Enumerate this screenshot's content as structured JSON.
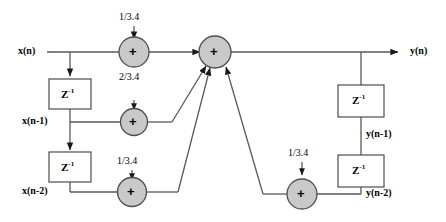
{
  "diagram": {
    "type": "signal-flow-diagram",
    "colors": {
      "line": "#595959",
      "adder_fill": "#c9c9c9",
      "adder_stroke": "#4d4d4d",
      "box_stroke": "#4d4d4d",
      "box_fill": "#ffffff",
      "text": "#000000",
      "background": "#ffffff"
    },
    "signals": {
      "input": "x(n)",
      "input_d1": "x(n-1)",
      "input_d2": "x(n-2)",
      "output": "y(n)",
      "output_d1": "y(n-1)",
      "output_d2": "y(n-2)"
    },
    "coefficients": {
      "top_gain": "1/3.4",
      "mid_gain": "2/3.4",
      "lower_left_gain": "1/3.4",
      "lower_right_gain": "1/3.4"
    },
    "delay_blocks": {
      "z_inverse": "Z",
      "z_exponent": "-1"
    },
    "adders": {
      "symbol": "+",
      "names": [
        "adder-input-top",
        "adder-input-mid",
        "adder-input-bottom",
        "adder-main",
        "adder-feedback"
      ]
    }
  }
}
